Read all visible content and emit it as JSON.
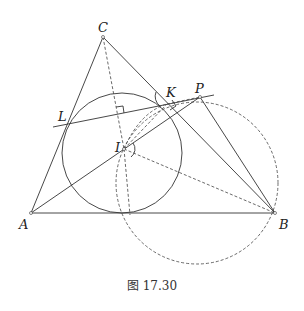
{
  "figure": {
    "caption": "图 17.30",
    "points": {
      "A": {
        "label": "A",
        "x": 31,
        "y": 213
      },
      "B": {
        "label": "B",
        "x": 275,
        "y": 213
      },
      "C": {
        "label": "C",
        "x": 103,
        "y": 37
      },
      "I": {
        "label": "I",
        "x": 124,
        "y": 149
      },
      "L": {
        "label": "L",
        "x": 67,
        "y": 122
      },
      "K": {
        "label": "K",
        "x": 167,
        "y": 104
      },
      "P": {
        "label": "P",
        "x": 200,
        "y": 97
      }
    },
    "incircle": {
      "cx": 122,
      "cy": 153,
      "r": 60,
      "style": "solid"
    },
    "dashed_circle": {
      "cx": 197,
      "cy": 183,
      "r": 81,
      "style": "dashed"
    },
    "colors": {
      "stroke": "#333333",
      "background": "#ffffff"
    }
  }
}
